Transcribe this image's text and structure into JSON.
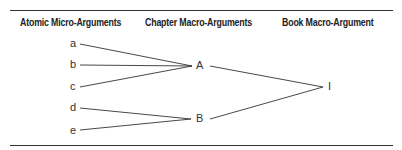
{
  "headers": {
    "micro": "Atomic Micro-Arguments",
    "chapter": "Chapter Macro-Arguments",
    "book": "Book Macro-Argument"
  },
  "nodes": {
    "micro": [
      "a",
      "b",
      "c",
      "d",
      "e"
    ],
    "chapter": [
      "A",
      "B"
    ],
    "book": "I"
  },
  "edges": [
    [
      "a",
      "A"
    ],
    [
      "b",
      "A"
    ],
    [
      "c",
      "A"
    ],
    [
      "d",
      "B"
    ],
    [
      "e",
      "B"
    ],
    [
      "A",
      "I"
    ],
    [
      "B",
      "I"
    ]
  ],
  "colors": {
    "line": "#333333",
    "text": "#222222"
  }
}
